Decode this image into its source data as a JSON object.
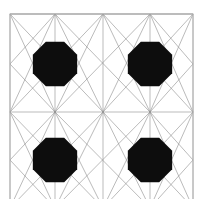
{
  "figure": {
    "name": "geometric-lattice-pattern",
    "canvas": {
      "width": 203,
      "height": 199,
      "background_color": "#ffffff"
    },
    "frame": {
      "name": "cell-boundary-frame",
      "x": 10,
      "y": 14,
      "width": 183,
      "height": 194,
      "stroke_color": "#b4b4b4",
      "stroke_width": 1,
      "fill": "none",
      "clipped_at_bottom": true
    },
    "lattice": {
      "x_positions": [
        10,
        55,
        103,
        150,
        193
      ],
      "y_positions": [
        14,
        64,
        112,
        160,
        208
      ],
      "vertex_columns": [
        10,
        55,
        103,
        150,
        193
      ],
      "vertex_rows": [
        14,
        112,
        208
      ],
      "cell_center_columns": [
        55,
        150
      ],
      "cell_center_rows": [
        64,
        160
      ]
    },
    "lines": {
      "name": "line-network",
      "stroke_color": "#8c8c8c",
      "stroke_width": 0.7,
      "opacity": 0.85,
      "count": 48,
      "style": "straight-segments",
      "segments": [
        [
          10,
          14,
          55,
          112
        ],
        [
          10,
          14,
          103,
          112
        ],
        [
          10,
          14,
          103,
          14
        ],
        [
          55,
          14,
          10,
          112
        ],
        [
          55,
          14,
          103,
          112
        ],
        [
          55,
          14,
          150,
          112
        ],
        [
          103,
          14,
          10,
          112
        ],
        [
          103,
          14,
          55,
          112
        ],
        [
          103,
          14,
          150,
          112
        ],
        [
          103,
          14,
          193,
          112
        ],
        [
          150,
          14,
          55,
          112
        ],
        [
          150,
          14,
          103,
          112
        ],
        [
          150,
          14,
          193,
          112
        ],
        [
          193,
          14,
          103,
          112
        ],
        [
          193,
          14,
          150,
          112
        ],
        [
          193,
          14,
          103,
          14
        ],
        [
          10,
          112,
          55,
          208
        ],
        [
          10,
          112,
          103,
          208
        ],
        [
          55,
          112,
          10,
          208
        ],
        [
          55,
          112,
          103,
          208
        ],
        [
          55,
          112,
          150,
          208
        ],
        [
          103,
          112,
          10,
          208
        ],
        [
          103,
          112,
          55,
          208
        ],
        [
          103,
          112,
          150,
          208
        ],
        [
          103,
          112,
          193,
          208
        ],
        [
          150,
          112,
          55,
          208
        ],
        [
          150,
          112,
          103,
          208
        ],
        [
          150,
          112,
          193,
          208
        ],
        [
          193,
          112,
          103,
          208
        ],
        [
          193,
          112,
          150,
          208
        ],
        [
          10,
          14,
          10,
          208
        ],
        [
          193,
          14,
          193,
          208
        ],
        [
          10,
          112,
          193,
          112
        ],
        [
          10,
          14,
          193,
          14
        ],
        [
          55,
          14,
          55,
          112
        ],
        [
          150,
          14,
          150,
          112
        ],
        [
          55,
          112,
          55,
          208
        ],
        [
          150,
          112,
          150,
          208
        ],
        [
          103,
          14,
          103,
          112
        ],
        [
          103,
          112,
          103,
          208
        ],
        [
          10,
          64,
          55,
          14
        ],
        [
          10,
          64,
          55,
          112
        ],
        [
          193,
          64,
          150,
          14
        ],
        [
          193,
          64,
          150,
          112
        ],
        [
          10,
          160,
          55,
          112
        ],
        [
          10,
          160,
          55,
          208
        ],
        [
          193,
          160,
          150,
          112
        ],
        [
          193,
          160,
          150,
          208
        ]
      ]
    },
    "nodes": {
      "name": "octagonal-nodes",
      "shape": "octagon",
      "fill_color": "#0d0d0d",
      "radius": 24,
      "count": 4,
      "positions": [
        {
          "label": "node-top-left",
          "cx": 55,
          "cy": 64
        },
        {
          "label": "node-top-right",
          "cx": 150,
          "cy": 64
        },
        {
          "label": "node-bottom-left",
          "cx": 55,
          "cy": 160
        },
        {
          "label": "node-bottom-right",
          "cx": 150,
          "cy": 160
        }
      ]
    }
  }
}
